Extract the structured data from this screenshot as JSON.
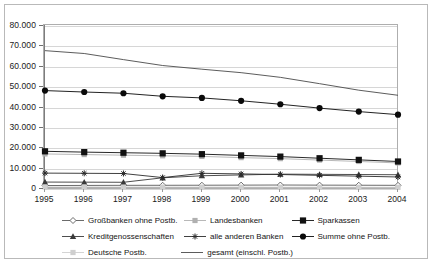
{
  "chart_data": {
    "type": "line",
    "title": "",
    "xlabel": "",
    "ylabel": "",
    "categories": [
      "1995",
      "1996",
      "1997",
      "1998",
      "1999",
      "2000",
      "2001",
      "2002",
      "2003",
      "2004"
    ],
    "x": [
      1995,
      1996,
      1997,
      1998,
      1999,
      2000,
      2001,
      2002,
      2003,
      2004
    ],
    "ylim": [
      0,
      80000
    ],
    "ytick_values": [
      0,
      10000,
      20000,
      30000,
      40000,
      50000,
      60000,
      70000,
      80000
    ],
    "ytick_labels": [
      "0",
      "10.000",
      "20.000",
      "30.000",
      "40.000",
      "50.000",
      "60.000",
      "70.000",
      "80.000"
    ],
    "grid": true,
    "legend_position": "bottom",
    "series": [
      {
        "name": "Großbanken ohne Postb.",
        "marker": "diamond-open",
        "color": "#5a5a5a",
        "values": [
          1700,
          1750,
          1800,
          1820,
          1850,
          1900,
          1950,
          1900,
          1850,
          1800
        ]
      },
      {
        "name": "Landesbanken",
        "marker": "square-light",
        "color": "#b0b0b0",
        "values": [
          17200,
          16900,
          16600,
          16300,
          16000,
          15400,
          14900,
          14200,
          13500,
          12800
        ]
      },
      {
        "name": "Sparkassen",
        "marker": "square-filled",
        "color": "#111111",
        "values": [
          18500,
          18100,
          17800,
          17500,
          17100,
          16500,
          15900,
          15100,
          14300,
          13500
        ]
      },
      {
        "name": "Kreditgenossenschaften",
        "marker": "triangle-filled",
        "color": "#3a3a3a",
        "values": [
          3400,
          3350,
          3300,
          5500,
          6500,
          6900,
          7300,
          7200,
          7100,
          7000
        ]
      },
      {
        "name": "alle anderen Banken",
        "marker": "asterisk",
        "color": "#2b2b2b",
        "values": [
          7800,
          7700,
          7600,
          5600,
          7700,
          7400,
          7100,
          6700,
          6300,
          5900
        ]
      },
      {
        "name": "Summe ohne  Postb.",
        "marker": "circle-filled",
        "color": "#0a0a0a",
        "values": [
          48300,
          47600,
          47000,
          45500,
          44700,
          43300,
          41600,
          39700,
          38000,
          36500
        ]
      },
      {
        "name": "Deutsche Postb.",
        "marker": "square-pale",
        "color": "#cfcfcf",
        "values": [
          1000,
          980,
          960,
          940,
          920,
          900,
          880,
          860,
          840,
          820
        ]
      },
      {
        "name": "gesamt (einschl.  Postb.)",
        "marker": "line-only",
        "color": "#4a4a4a",
        "values": [
          67900,
          66500,
          63500,
          60600,
          58800,
          57100,
          54800,
          51700,
          48500,
          46000
        ]
      }
    ]
  },
  "legend": {
    "rows": [
      [
        {
          "label": "Großbanken ohne Postb.",
          "key": "diamond-open"
        },
        {
          "label": "Landesbanken",
          "key": "square-light"
        },
        {
          "label": "Sparkassen",
          "key": "square-filled"
        }
      ],
      [
        {
          "label": "Kreditgenossenschaften",
          "key": "triangle-filled"
        },
        {
          "label": "alle anderen Banken",
          "key": "asterisk"
        },
        {
          "label": "Summe ohne  Postb.",
          "key": "circle-filled"
        }
      ],
      [
        {
          "label": "Deutsche Postb.",
          "key": "square-pale"
        },
        {
          "label": "gesamt (einschl.  Postb.)",
          "key": "line-only"
        },
        {
          "label": "",
          "key": "none"
        }
      ]
    ]
  },
  "colors": {
    "plot_border": "#aeaeae",
    "grid": "#d6d6d6",
    "frame": "#b9b9b9",
    "text": "#1a1a1a"
  }
}
